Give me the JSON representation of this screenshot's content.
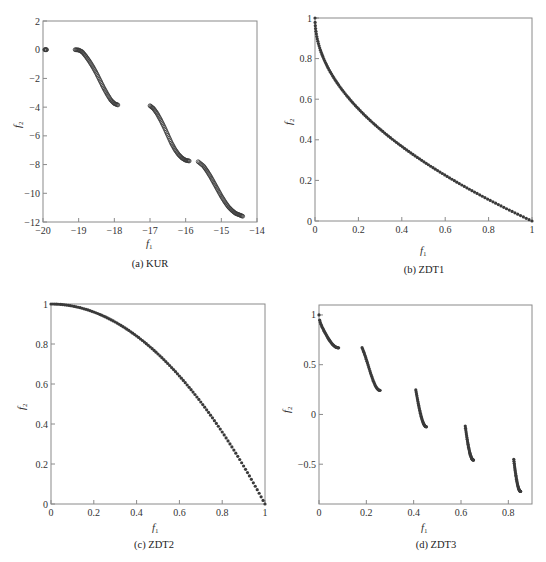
{
  "chart_data": [
    {
      "id": "kur",
      "type": "scatter",
      "title": "",
      "caption": "(a)  KUR",
      "xlabel": "f1",
      "ylabel": "f2",
      "xlim": [
        -20,
        -14
      ],
      "ylim": [
        -12,
        2
      ],
      "xticks": [
        -20,
        -19,
        -18,
        -17,
        -16,
        -15,
        -14
      ],
      "xtick_labels": [
        "−20",
        "−19",
        "−18",
        "−17",
        "−16",
        "−15",
        "−14"
      ],
      "yticks": [
        -12,
        -10,
        -8,
        -6,
        -4,
        -2,
        0,
        2
      ],
      "ytick_labels": [
        "−12",
        "−10",
        "−8",
        "−6",
        "−4",
        "−2",
        "0",
        "2"
      ],
      "grid": false,
      "marker": "open-circle",
      "segments": [
        {
          "x": [
            -19.95,
            -19.9
          ],
          "y": [
            0.0,
            0.0
          ]
        },
        {
          "x": [
            -19.1,
            -19.0,
            -18.9,
            -18.8,
            -18.7,
            -18.6,
            -18.5,
            -18.4,
            -18.3,
            -18.2,
            -18.1,
            -18.0,
            -17.9
          ],
          "y": [
            0.0,
            -0.02,
            -0.15,
            -0.45,
            -0.8,
            -1.2,
            -1.65,
            -2.15,
            -2.65,
            -3.1,
            -3.5,
            -3.75,
            -3.85
          ]
        },
        {
          "x": [
            -17.0,
            -16.9,
            -16.8,
            -16.7,
            -16.6,
            -16.5,
            -16.4,
            -16.3,
            -16.2,
            -16.1,
            -16.0,
            -15.9
          ],
          "y": [
            -3.9,
            -4.1,
            -4.45,
            -4.9,
            -5.4,
            -5.95,
            -6.5,
            -6.95,
            -7.3,
            -7.55,
            -7.7,
            -7.75
          ]
        },
        {
          "x": [
            -15.65,
            -15.5,
            -15.4,
            -15.3,
            -15.2,
            -15.1,
            -15.0,
            -14.9,
            -14.8,
            -14.7,
            -14.6,
            -14.5,
            -14.4
          ],
          "y": [
            -7.8,
            -8.1,
            -8.45,
            -8.85,
            -9.3,
            -9.75,
            -10.2,
            -10.6,
            -10.95,
            -11.2,
            -11.4,
            -11.5,
            -11.6
          ]
        }
      ]
    },
    {
      "id": "zdt1",
      "type": "scatter",
      "title": "",
      "caption": "(b)  ZDT1",
      "xlabel": "f1",
      "ylabel": "f2",
      "xlim": [
        0,
        1
      ],
      "ylim": [
        0,
        1
      ],
      "xticks": [
        0,
        0.2,
        0.4,
        0.6,
        0.8,
        1
      ],
      "xtick_labels": [
        "0",
        "0.2",
        "0.4",
        "0.6",
        "0.8",
        "1"
      ],
      "yticks": [
        0,
        0.2,
        0.4,
        0.6,
        0.8,
        1
      ],
      "ytick_labels": [
        "0",
        "0.2",
        "0.4",
        "0.6",
        "0.8",
        "1"
      ],
      "grid": false,
      "marker": "dot",
      "curve": "f2 = 1 - sqrt(f1)",
      "x": [
        0,
        0.01,
        0.02,
        0.04,
        0.06,
        0.1,
        0.15,
        0.2,
        0.3,
        0.4,
        0.5,
        0.6,
        0.7,
        0.8,
        0.9,
        1.0
      ],
      "y": [
        1.0,
        0.9,
        0.859,
        0.8,
        0.755,
        0.684,
        0.613,
        0.553,
        0.452,
        0.368,
        0.293,
        0.225,
        0.163,
        0.106,
        0.051,
        0.0
      ]
    },
    {
      "id": "zdt2",
      "type": "scatter",
      "title": "",
      "caption": "(c)  ZDT2",
      "xlabel": "f1",
      "ylabel": "f2",
      "xlim": [
        0,
        1
      ],
      "ylim": [
        0,
        1
      ],
      "xticks": [
        0,
        0.2,
        0.4,
        0.6,
        0.8,
        1
      ],
      "xtick_labels": [
        "0",
        "0.2",
        "0.4",
        "0.6",
        "0.8",
        "1"
      ],
      "yticks": [
        0,
        0.2,
        0.4,
        0.6,
        0.8,
        1
      ],
      "ytick_labels": [
        "0",
        "0.2",
        "0.4",
        "0.6",
        "0.8",
        "1"
      ],
      "grid": false,
      "marker": "dot",
      "curve": "f2 = 1 - f1^2",
      "x": [
        0,
        0.1,
        0.2,
        0.3,
        0.4,
        0.5,
        0.6,
        0.7,
        0.8,
        0.9,
        1.0
      ],
      "y": [
        1.0,
        0.99,
        0.96,
        0.91,
        0.84,
        0.75,
        0.64,
        0.51,
        0.36,
        0.19,
        0.0
      ]
    },
    {
      "id": "zdt3",
      "type": "scatter",
      "title": "",
      "caption": "(d)  ZDT3",
      "xlabel": "f1",
      "ylabel": "f2",
      "xlim": [
        0,
        0.9
      ],
      "ylim": [
        -0.9,
        1.1
      ],
      "xticks": [
        0,
        0.2,
        0.4,
        0.6,
        0.8
      ],
      "xtick_labels": [
        "0",
        "0.2",
        "0.4",
        "0.6",
        "0.8"
      ],
      "yticks": [
        -0.5,
        0,
        0.5,
        1
      ],
      "ytick_labels": [
        "−0.5",
        "0",
        "0.5",
        "1"
      ],
      "grid": false,
      "marker": "dot",
      "curve": "f2 = 1 - sqrt(f1) - f1*sin(10*pi*f1)",
      "segments": [
        {
          "x_range": [
            0.0,
            0.083
          ],
          "y_start": 1.0,
          "y_end": 0.67
        },
        {
          "x_range": [
            0.182,
            0.258
          ],
          "y_start": 0.67,
          "y_end": 0.24
        },
        {
          "x_range": [
            0.409,
            0.454
          ],
          "y_start": 0.25,
          "y_end": -0.12
        },
        {
          "x_range": [
            0.618,
            0.653
          ],
          "y_start": -0.12,
          "y_end": -0.45
        },
        {
          "x_range": [
            0.823,
            0.852
          ],
          "y_start": -0.45,
          "y_end": -0.77
        }
      ]
    }
  ],
  "panels": [
    {
      "caption": "(a)  KUR",
      "xlabel_main": "f",
      "xlabel_sub": "1",
      "ylabel_main": "f",
      "ylabel_sub": "2"
    },
    {
      "caption": "(b)  ZDT1",
      "xlabel_main": "f",
      "xlabel_sub": "1",
      "ylabel_main": "f",
      "ylabel_sub": "2"
    },
    {
      "caption": "(c)  ZDT2",
      "xlabel_main": "f",
      "xlabel_sub": "1",
      "ylabel_main": "f",
      "ylabel_sub": "2"
    },
    {
      "caption": "(d)  ZDT3",
      "xlabel_main": "f",
      "xlabel_sub": "1",
      "ylabel_main": "f",
      "ylabel_sub": "2"
    }
  ],
  "style": {
    "frame_color": "#8a8a8a",
    "marker_color": "#3a3a3a",
    "text_color": "#333333"
  }
}
